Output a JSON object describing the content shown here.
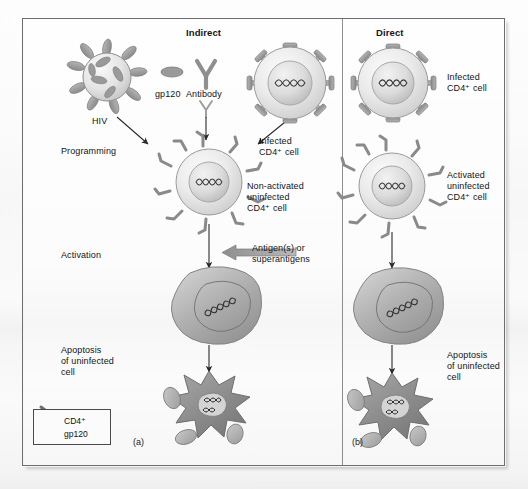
{
  "figure": {
    "panel_a_id": "(a)",
    "panel_b_id": "(b)"
  },
  "panel_a": {
    "heading": "Indirect",
    "labels": {
      "hiv": "HIV",
      "gp120": "gp120",
      "antibody": "Antibody",
      "programming": "Programming",
      "infected_cell": "Infected\nCD4⁺ cell",
      "nonactivated_cell": "Non-activated\nuninfected\nCD4⁺ cell",
      "activation": "Activation",
      "antigens": "Antigen(s) or\nsuperantigens",
      "apoptosis": "Apoptosis\nof uninfected\ncell"
    }
  },
  "panel_b": {
    "heading": "Direct",
    "labels": {
      "infected_cell": "Infected\nCD4⁺ cell",
      "activated_cell": "Activated\nuninfected\nCD4⁺ cell",
      "apoptosis": "Apoptosis\nof uninfected\ncell"
    }
  },
  "legend": {
    "cd4_label": "CD4⁺",
    "gp120_label": "gp120"
  },
  "colors": {
    "ink": "#141414",
    "frame": "#6e6e6e",
    "cell_fill": "#e8e8e8",
    "cell_edge": "#8f8f8f",
    "nucleus": "#d8d8d8",
    "spike": "#9a9a9a",
    "receptor": "#8a8a8a",
    "blob": "#a9a9a9",
    "apoptotic": "#8c8c8c",
    "arrow": "#2a2a2a",
    "block_arrow": "#a0a0a0"
  }
}
